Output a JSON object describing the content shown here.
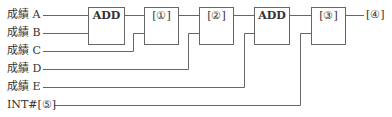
{
  "inputs": [
    {
      "label": "成績 A",
      "y": 15
    },
    {
      "label": "成績 B",
      "y": 33
    },
    {
      "label": "成績 C",
      "y": 51
    },
    {
      "label": "成績 D",
      "y": 69
    },
    {
      "label": "成績 E",
      "y": 87
    },
    {
      "label": "INT#[⑤]",
      "y": 105
    }
  ],
  "blocks": [
    {
      "label": "ADD",
      "x": 88,
      "w": 36
    },
    {
      "label": "[①]",
      "x": 144,
      "w": 34
    },
    {
      "label": "[②]",
      "x": 199,
      "w": 34
    },
    {
      "label": "ADD",
      "x": 254,
      "w": 35
    },
    {
      "label": "[③]",
      "x": 311,
      "w": 34
    }
  ],
  "output": {
    "label": "[④]"
  },
  "colors": {
    "line": "#666666",
    "text": "#333333"
  }
}
